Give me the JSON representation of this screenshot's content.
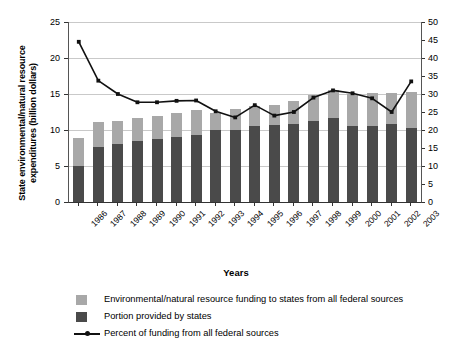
{
  "chart_data": {
    "type": "bar",
    "title": "",
    "subtitle": "",
    "xlabel": "Years",
    "ylabel": "State environmental/natural resource expenditures (billion dollars)",
    "ylabel_right": "Percent of federal funding",
    "categories": [
      "1986",
      "1987",
      "1988",
      "1989",
      "1990",
      "1991",
      "1992",
      "1993",
      "1994",
      "1995",
      "1996",
      "1997",
      "1998",
      "1999",
      "2000",
      "2001",
      "2002",
      "2003"
    ],
    "ylim": [
      0,
      25
    ],
    "yticks": [
      "0",
      "5",
      "10",
      "15",
      "20",
      "25"
    ],
    "ylim_right": [
      0,
      50
    ],
    "yticks_right": [
      "0",
      "5",
      "10",
      "15",
      "20",
      "25",
      "30",
      "35",
      "40",
      "45",
      "50"
    ],
    "grid": true,
    "legend_position": "below-left",
    "stacked": true,
    "series": [
      {
        "name": "Environmental/natural resource funding to states from all federal sources",
        "type": "bar-stack-total",
        "color": "#a8a8a8",
        "axis": "left",
        "values": [
          8.9,
          11.1,
          11.3,
          11.6,
          11.9,
          12.4,
          12.8,
          12.4,
          12.9,
          13.3,
          13.5,
          14.0,
          14.8,
          15.6,
          15.0,
          15.2,
          15.2,
          15.3
        ]
      },
      {
        "name": "Portion provided by states",
        "type": "bar-stack-lower",
        "color": "#4a4a4a",
        "axis": "left",
        "values": [
          5.0,
          7.6,
          8.1,
          8.5,
          8.8,
          9.0,
          9.3,
          10.0,
          10.0,
          10.5,
          10.7,
          10.8,
          11.2,
          11.7,
          10.6,
          10.6,
          10.9,
          10.3
        ]
      },
      {
        "name": "Percent of funding from all federal sources",
        "type": "line",
        "color": "#111111",
        "axis": "right",
        "values": [
          44.5,
          33.7,
          30.0,
          27.7,
          27.7,
          28.1,
          28.2,
          25.2,
          23.5,
          26.9,
          24.0,
          25.0,
          29.0,
          31.0,
          30.2,
          28.8,
          25.0,
          33.5
        ]
      }
    ],
    "legend": [
      {
        "label": "Environmental/natural resource funding to states from all federal sources",
        "marker": "square",
        "color": "#a8a8a8"
      },
      {
        "label": "Portion provided by states",
        "marker": "square",
        "color": "#4a4a4a"
      },
      {
        "label": "Percent of funding from all federal sources",
        "marker": "line-dot",
        "color": "#111111"
      }
    ]
  },
  "colors": {
    "bar_light": "#a8a8a8",
    "bar_dark": "#4a4a4a",
    "line": "#111111",
    "grid": "#c9c9c9",
    "axis": "#333333",
    "background": "#ffffff"
  }
}
